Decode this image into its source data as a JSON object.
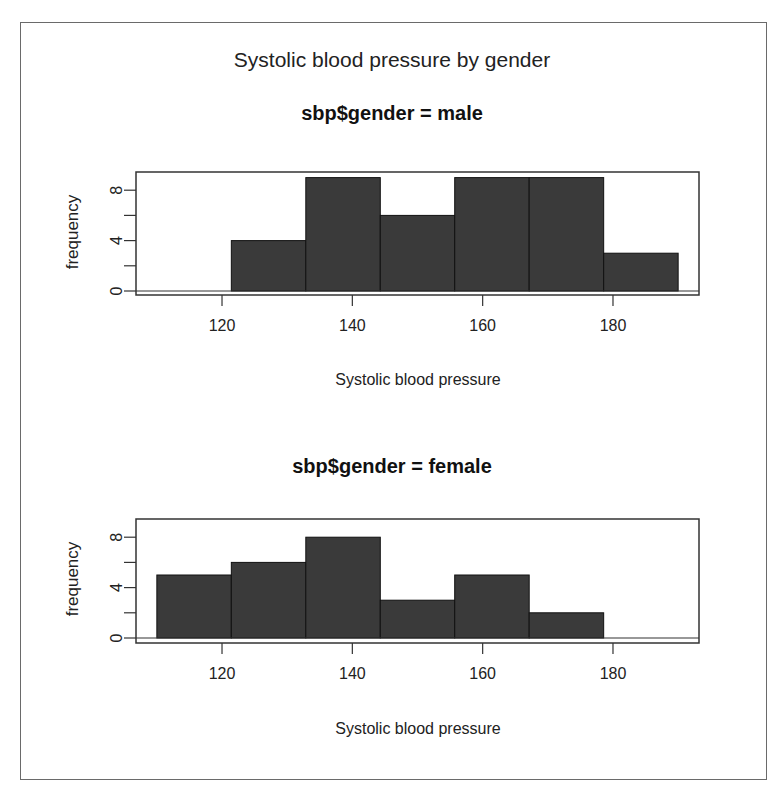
{
  "figure": {
    "main_title": "Systolic blood pressure by gender",
    "panels": [
      {
        "title": "sbp$gender = male",
        "ylabel": "frequency",
        "xlabel": "Systolic blood pressure"
      },
      {
        "title": "sbp$gender = female",
        "ylabel": "frequency",
        "xlabel": "Systolic blood pressure"
      }
    ],
    "colors": {
      "bar": "#3a3a3a",
      "bar_edge": "#111111",
      "axis": "#333333"
    }
  },
  "chart_data": [
    {
      "type": "bar",
      "title": "sbp$gender = male",
      "super_title": "Systolic blood pressure by gender",
      "xlabel": "Systolic blood pressure",
      "ylabel": "frequency",
      "bin_edges": [
        110,
        121.43,
        132.86,
        144.29,
        155.71,
        167.14,
        178.57,
        190
      ],
      "values": [
        0,
        4,
        9,
        6,
        9,
        9,
        3
      ],
      "xticks": [
        120,
        140,
        160,
        180
      ],
      "yticks": [
        0,
        4,
        8
      ],
      "yminor_ticks": [
        2,
        6
      ],
      "xlim": [
        106.8,
        193.2
      ],
      "ylim": [
        0,
        9.36
      ],
      "grid": false,
      "legend": null
    },
    {
      "type": "bar",
      "title": "sbp$gender = female",
      "super_title": "Systolic blood pressure by gender",
      "xlabel": "Systolic blood pressure",
      "ylabel": "frequency",
      "bin_edges": [
        110,
        121.43,
        132.86,
        144.29,
        155.71,
        167.14,
        178.57,
        190
      ],
      "values": [
        5,
        6,
        8,
        3,
        5,
        2,
        0
      ],
      "xticks": [
        120,
        140,
        160,
        180
      ],
      "yticks": [
        0,
        4,
        8
      ],
      "yminor_ticks": [
        2,
        6
      ],
      "xlim": [
        106.8,
        193.2
      ],
      "ylim": [
        0,
        9.36
      ],
      "grid": false,
      "legend": null
    }
  ]
}
